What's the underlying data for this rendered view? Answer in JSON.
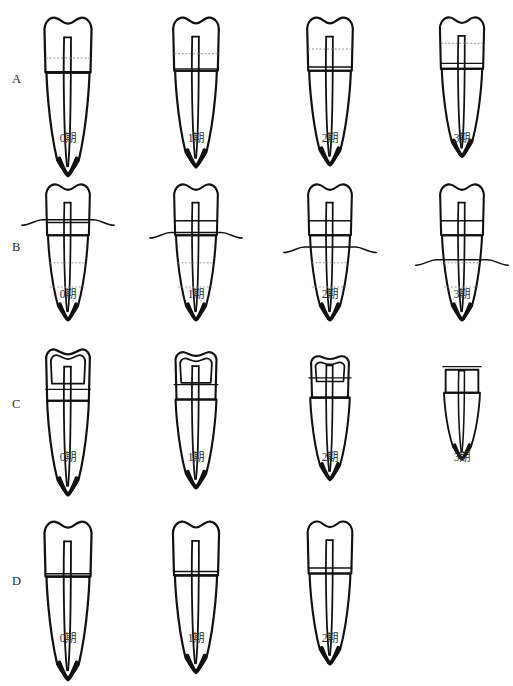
{
  "figure": {
    "background_color": "#ffffff",
    "ink_color": "#111111",
    "guide_color": "#8d8d8d",
    "width": 513,
    "height": 677
  },
  "rows": [
    {
      "label": "A",
      "label_y": 73,
      "row_top": 8,
      "tooth_top": 4,
      "caption_y": 133,
      "feature": "dashed-occlusal-line",
      "cells": [
        {
          "stage_label": "0期",
          "column_center": 68,
          "tooth_scale": 1.0,
          "dash_line_y": 43,
          "cej_line_y": 57,
          "pulp_depth": 104,
          "crown_style": "intact",
          "bone_line": null
        },
        {
          "stage_label": "1期",
          "column_center": 196,
          "tooth_scale": 0.97,
          "dash_line_y": 40,
          "cej_line_y": 56,
          "pulp_depth": 100,
          "crown_style": "intact",
          "bone_line": null
        },
        {
          "stage_label": "2期",
          "column_center": 330,
          "tooth_scale": 0.97,
          "dash_line_y": 35,
          "cej_line_y": 54,
          "pulp_depth": 98,
          "crown_style": "intact",
          "bone_line": null
        },
        {
          "stage_label": "3期",
          "column_center": 462,
          "tooth_scale": 0.94,
          "dash_line_y": 30,
          "cej_line_y": 52,
          "pulp_depth": 94,
          "crown_style": "intact",
          "bone_line": null
        }
      ]
    },
    {
      "label": "B",
      "label_y": 241,
      "row_top": 175,
      "tooth_top": 4,
      "caption_y": 289,
      "feature": "descending-bone-level",
      "cells": [
        {
          "stage_label": "0期",
          "column_center": 68,
          "tooth_scale": 0.93,
          "dash_line_y": null,
          "cej_line_y": 44,
          "pulp_depth": 92,
          "crown_style": "intact",
          "bone_line": 44
        },
        {
          "stage_label": "1期",
          "column_center": 196,
          "tooth_scale": 0.93,
          "dash_line_y": null,
          "cej_line_y": 42,
          "pulp_depth": 92,
          "crown_style": "intact",
          "bone_line": 58
        },
        {
          "stage_label": "2期",
          "column_center": 330,
          "tooth_scale": 0.93,
          "dash_line_y": null,
          "cej_line_y": 42,
          "pulp_depth": 92,
          "crown_style": "intact",
          "bone_line": 74
        },
        {
          "stage_label": "3期",
          "column_center": 462,
          "tooth_scale": 0.93,
          "dash_line_y": null,
          "cej_line_y": 42,
          "pulp_depth": 92,
          "crown_style": "intact",
          "bone_line": 88
        }
      ]
    },
    {
      "label": "C",
      "label_y": 398,
      "row_top": 338,
      "tooth_top": 4,
      "caption_y": 452,
      "feature": "progressive-crown-attrition",
      "cells": [
        {
          "stage_label": "0期",
          "column_center": 68,
          "tooth_scale": 0.97,
          "dash_line_y": null,
          "cej_line_y": 46,
          "pulp_depth": 98,
          "crown_style": "worn-1",
          "bone_line": null
        },
        {
          "stage_label": "1期",
          "column_center": 196,
          "tooth_scale": 0.95,
          "dash_line_y": null,
          "cej_line_y": 42,
          "pulp_depth": 94,
          "crown_style": "worn-2",
          "bone_line": null
        },
        {
          "stage_label": "2期",
          "column_center": 330,
          "tooth_scale": 0.92,
          "dash_line_y": null,
          "cej_line_y": 36,
          "pulp_depth": 90,
          "crown_style": "worn-3",
          "bone_line": null
        },
        {
          "stage_label": "3期",
          "column_center": 462,
          "tooth_scale": 0.84,
          "dash_line_y": null,
          "cej_line_y": 26,
          "pulp_depth": 80,
          "crown_style": "worn-flat",
          "bone_line": null
        }
      ]
    },
    {
      "label": "D",
      "label_y": 575,
      "row_top": 512,
      "tooth_top": 4,
      "caption_y": 633,
      "feature": "apical-root-change",
      "cells": [
        {
          "stage_label": "0期",
          "column_center": 68,
          "tooth_scale": 1.0,
          "dash_line_y": null,
          "cej_line_y": 55,
          "pulp_depth": 104,
          "crown_style": "intact",
          "bone_line": null
        },
        {
          "stage_label": "1期",
          "column_center": 196,
          "tooth_scale": 0.98,
          "dash_line_y": null,
          "cej_line_y": 54,
          "pulp_depth": 100,
          "crown_style": "intact",
          "bone_line": null
        },
        {
          "stage_label": "2期",
          "column_center": 330,
          "tooth_scale": 0.95,
          "dash_line_y": null,
          "cej_line_y": 52,
          "pulp_depth": 96,
          "crown_style": "intact",
          "bone_line": null
        }
      ]
    }
  ]
}
